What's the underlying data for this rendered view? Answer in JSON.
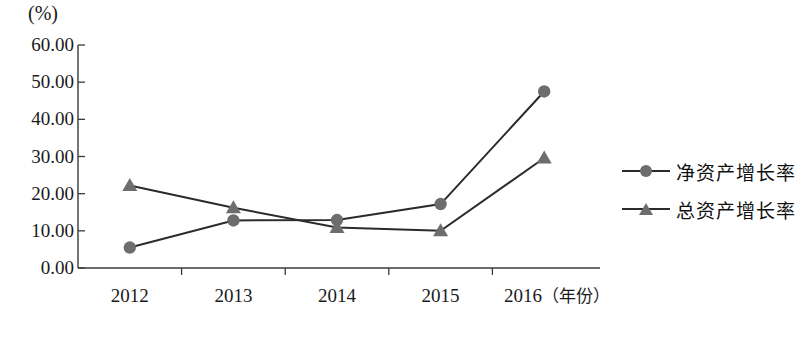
{
  "chart_data": {
    "type": "line",
    "title": "",
    "unit_label": "(%)",
    "xlabel": "（年份）",
    "ylabel": "",
    "categories": [
      "2012",
      "2013",
      "2014",
      "2015",
      "2016"
    ],
    "ylim": [
      0,
      60
    ],
    "yticks": [
      "60.00",
      "50.00",
      "40.00",
      "30.00",
      "20.00",
      "10.00",
      "0.00"
    ],
    "ytick_values": [
      60,
      50,
      40,
      30,
      20,
      10,
      0
    ],
    "grid": false,
    "legend_position": "right",
    "series": [
      {
        "name": "净资产增长率",
        "marker": "circle",
        "color": "#6d6d6d",
        "line_color": "#2b2b2b",
        "values": [
          5.5,
          12.8,
          12.9,
          17.2,
          47.5
        ]
      },
      {
        "name": "总资产增长率",
        "marker": "triangle",
        "color": "#6d6d6d",
        "line_color": "#2b2b2b",
        "values": [
          22.2,
          16.2,
          10.9,
          10.0,
          29.6
        ]
      }
    ]
  },
  "axis": {
    "line_color": "#3a3a3a"
  }
}
